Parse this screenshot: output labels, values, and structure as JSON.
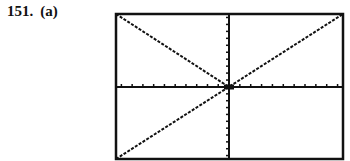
{
  "exercise": {
    "number": "151.",
    "part": "(a)"
  },
  "chart_data": {
    "type": "line",
    "title": "",
    "xlabel": "",
    "ylabel": "",
    "xlim": [
      -10,
      10
    ],
    "ylim": [
      -10,
      10
    ],
    "grid": false,
    "x_ticks_each_side": 10,
    "y_ticks_each_side": 10,
    "series": [
      {
        "name": "y = -x",
        "x": [
          -10,
          0
        ],
        "y": [
          10,
          0
        ],
        "style": "dotted"
      },
      {
        "name": "y = x",
        "x": [
          -10,
          10
        ],
        "y": [
          -10,
          10
        ],
        "style": "dotted"
      }
    ],
    "colors": {
      "line": "#111111",
      "frame": "#111111",
      "background": "#ffffff"
    }
  }
}
